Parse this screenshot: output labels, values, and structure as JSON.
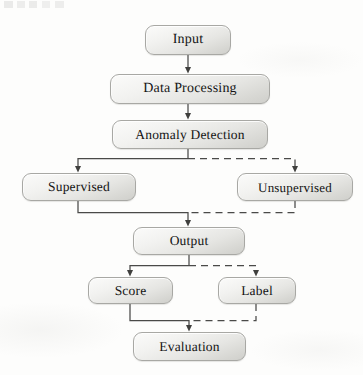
{
  "diagram": {
    "style": {
      "background_color": "#fdfdfc",
      "node_fill_light": "#fbfbfa",
      "node_fill_dark": "#cfcfcb",
      "node_border_color": "#a8a8a4",
      "text_color": "#141414",
      "connector_color": "#4a4a48"
    },
    "nodes": [
      {
        "id": "input",
        "label": "Input",
        "x": 145,
        "y": 25,
        "w": 86,
        "h": 30,
        "font_size": 14
      },
      {
        "id": "data_processing",
        "label": "Data Processing",
        "x": 110,
        "y": 74,
        "w": 160,
        "h": 30,
        "font_size": 14
      },
      {
        "id": "anomaly_detection",
        "label": "Anomaly Detection",
        "x": 112,
        "y": 120,
        "w": 156,
        "h": 29,
        "font_size": 13
      },
      {
        "id": "supervised",
        "label": "Supervised",
        "x": 22,
        "y": 173,
        "w": 114,
        "h": 28,
        "font_size": 13
      },
      {
        "id": "unsupervised",
        "label": "Unsupervised",
        "x": 237,
        "y": 173,
        "w": 116,
        "h": 28,
        "font_size": 13
      },
      {
        "id": "output",
        "label": "Output",
        "x": 133,
        "y": 227,
        "w": 112,
        "h": 28,
        "font_size": 13
      },
      {
        "id": "score",
        "label": "Score",
        "x": 88,
        "y": 277,
        "w": 85,
        "h": 27,
        "font_size": 13
      },
      {
        "id": "label",
        "label": "Label",
        "x": 218,
        "y": 277,
        "w": 78,
        "h": 27,
        "font_size": 13
      },
      {
        "id": "evaluation",
        "label": "Evaluation",
        "x": 133,
        "y": 332,
        "w": 113,
        "h": 29,
        "font_size": 13
      }
    ],
    "edges": [
      {
        "id": "input-to-data-processing",
        "from": "input",
        "to": "data_processing",
        "style": "solid"
      },
      {
        "id": "data-processing-to-anomaly",
        "from": "data_processing",
        "to": "anomaly_detection",
        "style": "solid"
      },
      {
        "id": "anomaly-to-supervised",
        "from": "anomaly_detection",
        "to": "supervised",
        "style": "solid"
      },
      {
        "id": "anomaly-to-unsupervised",
        "from": "anomaly_detection",
        "to": "unsupervised",
        "style": "dashed"
      },
      {
        "id": "supervised-to-output",
        "from": "supervised",
        "to": "output",
        "style": "solid"
      },
      {
        "id": "unsupervised-to-output",
        "from": "unsupervised",
        "to": "output",
        "style": "dashed"
      },
      {
        "id": "output-to-score",
        "from": "output",
        "to": "score",
        "style": "solid"
      },
      {
        "id": "output-to-label",
        "from": "output",
        "to": "label",
        "style": "dashed"
      },
      {
        "id": "score-to-evaluation",
        "from": "score",
        "to": "evaluation",
        "style": "solid"
      },
      {
        "id": "label-to-evaluation",
        "from": "label",
        "to": "evaluation",
        "style": "dashed"
      }
    ]
  }
}
